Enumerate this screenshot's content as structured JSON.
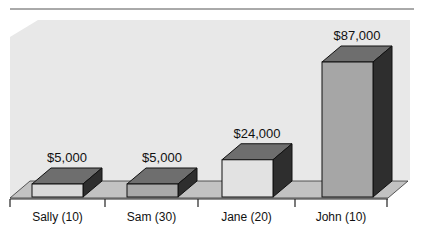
{
  "chart_data": {
    "type": "bar",
    "style": "3d",
    "title": "",
    "xlabel": "",
    "ylabel": "",
    "categories": [
      "Sally (10)",
      "Sam (30)",
      "Jane (20)",
      "John (10)"
    ],
    "values": [
      5000,
      5000,
      24000,
      87000
    ],
    "value_labels": [
      "$5,000",
      "$5,000",
      "$24,000",
      "$87,000"
    ],
    "ylim": [
      0,
      87000
    ],
    "grid": false,
    "legend": null,
    "colors": {
      "bar_fronts": [
        "#d9d9d9",
        "#a9a9a9",
        "#e2e2e2",
        "#a6a6a6"
      ],
      "bar_top": "#6e6e6e",
      "bar_side": "#2e2e2e",
      "back_wall": "#e8e8e8",
      "floor": "#c2c2c2",
      "axis": "#222222"
    }
  }
}
